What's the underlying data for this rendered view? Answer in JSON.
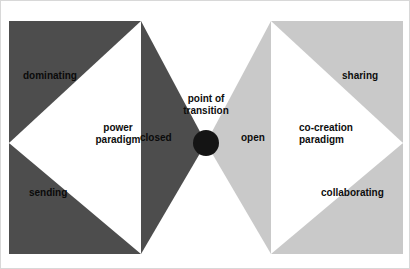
{
  "figure": {
    "background_color": "#ffffff",
    "border_color": "#d8d8d8",
    "width": 410,
    "height": 269
  },
  "colors": {
    "left_fill": "#4d4d4d",
    "right_fill": "#c9c9c9",
    "center_node": "#141414",
    "white_wedge": "#ffffff",
    "text": "#0d0d0d"
  },
  "center": {
    "node_label": "point of transition",
    "node_label_line1": "point of",
    "node_label_line2": "transition",
    "node_shape": "circle",
    "node_color": "#141414"
  },
  "left_side": {
    "side_name": "closed",
    "funnel_label": "closed",
    "paradigm_label": "power\nparadigm",
    "paradigm_label_line1": "power",
    "paradigm_label_line2": "paradigm",
    "attributes": [
      {
        "label": "dominating",
        "position": "top"
      },
      {
        "label": "sending",
        "position": "bottom"
      }
    ]
  },
  "right_side": {
    "side_name": "open",
    "funnel_label": "open",
    "paradigm_label": "co-creation\nparadigm",
    "paradigm_label_line1": "co-creation",
    "paradigm_label_line2": "paradigm",
    "attributes": [
      {
        "label": "sharing",
        "position": "top"
      },
      {
        "label": "collaborating",
        "position": "bottom"
      }
    ]
  }
}
